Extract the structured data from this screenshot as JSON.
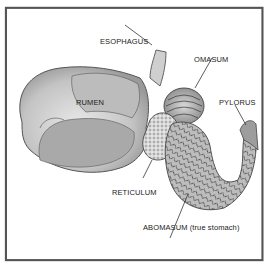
{
  "diagram": {
    "labels": {
      "esophagus": "ESOPHAGUS",
      "omasum": "OMASUM",
      "rumen": "RUMEN",
      "pylorus": "PYLORUS",
      "reticulum": "RETICULUM",
      "abomasum": "ABOMASUM (true stomach)"
    }
  }
}
